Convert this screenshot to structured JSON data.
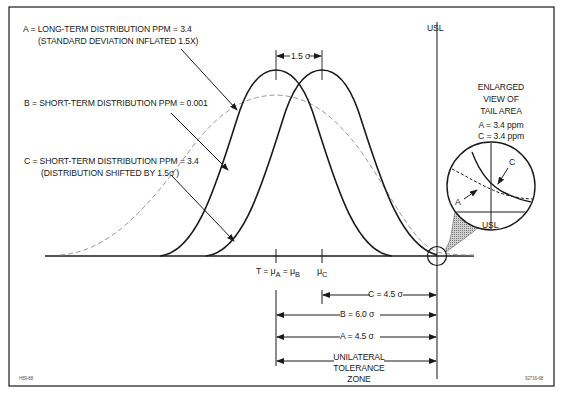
{
  "legend": {
    "a_line1": "A = LONG-TERM DISTRIBUTION PPM = 3.4",
    "a_line2": "(STANDARD DEVIATION INFLATED 1.5X)",
    "b_line1": "B = SHORT-TERM DISTRIBUTION PPM = 0.001",
    "c_line1": "C = SHORT-TERM DISTRIBUTION PPM = 3.4",
    "c_line2": "(DISTRIBUTION SHIFTED BY 1.5σ  )"
  },
  "shift_label": "1.5 σ",
  "usl_label": "USL",
  "tail_view": {
    "title_line1": "ENLARGED",
    "title_line2": "VIEW OF",
    "title_line3": "TAIL AREA",
    "a_value": "A = 3.4 ppm",
    "c_value": "C = 3.4 ppm",
    "a_marker": "A",
    "c_marker": "C",
    "usl_label": "USL"
  },
  "axis": {
    "target_prefix": "T = ",
    "mu_symbol": "μ",
    "mu_a_sub": "A",
    "mu_b_sub": "B",
    "mu_c_sub": "C",
    "eq": " = "
  },
  "dimensions": {
    "c_distance": "C = 4.5  σ",
    "b_distance": "B = 6.0  σ",
    "a_distance": "A = 4.5  σ",
    "zone_line1": "UNILATERAL",
    "zone_line2": "TOLERANCE",
    "zone_line3": "ZONE"
  },
  "footer": {
    "left_code": "H89-88",
    "right_code": "92716-68"
  },
  "colors": {
    "ink": "#1a1a1a",
    "dashed_curve": "#9a9a9a",
    "shading": "#8c8c8c"
  }
}
